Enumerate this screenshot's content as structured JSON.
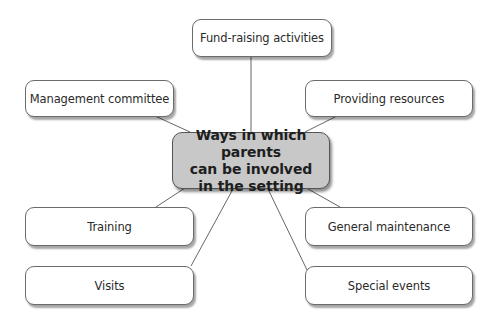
{
  "diagram": {
    "type": "mind-map",
    "center": {
      "lines": [
        "Ways in which parents",
        "can be involved",
        "in the setting"
      ]
    },
    "nodes": [
      {
        "id": "fundraising",
        "label": "Fund-raising activities"
      },
      {
        "id": "management",
        "label": "Management committee"
      },
      {
        "id": "resources",
        "label": "Providing resources"
      },
      {
        "id": "training",
        "label": "Training"
      },
      {
        "id": "maintenance",
        "label": "General maintenance"
      },
      {
        "id": "visits",
        "label": "Visits"
      },
      {
        "id": "events",
        "label": "Special events"
      }
    ],
    "colors": {
      "center_fill": "#c8c8c8",
      "node_fill": "#ffffff",
      "border": "#6b6b6b",
      "connector": "#555555"
    }
  }
}
